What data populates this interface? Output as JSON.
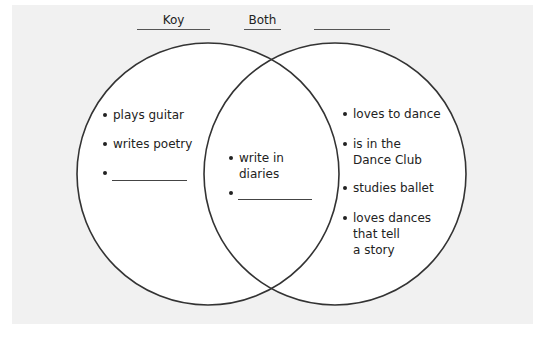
{
  "headers": {
    "left": "Koy",
    "center": "Both",
    "right": ""
  },
  "left_circle": {
    "items": [
      "plays guitar",
      "writes poetry",
      ""
    ]
  },
  "overlap": {
    "items": [
      "write in\ndiaries",
      ""
    ]
  },
  "right_circle": {
    "items": [
      "loves to dance",
      "is in the\nDance Club",
      "studies ballet",
      "loves dances\nthat tell\na story"
    ]
  },
  "colors": {
    "panel_bg": "#f1f1f1",
    "circle_fill": "#ffffff",
    "circle_stroke": "#333333"
  }
}
